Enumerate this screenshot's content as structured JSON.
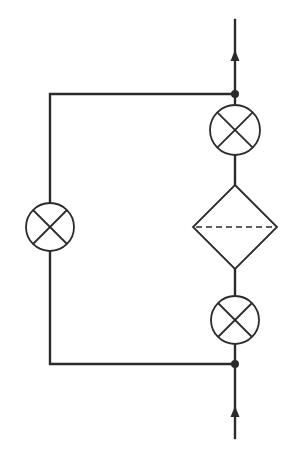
{
  "diagram": {
    "type": "signal-flow",
    "colors": {
      "line": "#2b2b2b",
      "background": "#ffffff"
    },
    "main_line": {
      "x": 235,
      "y_top": 20,
      "y_bottom": 438
    },
    "bypass_loop": {
      "x_left": 50,
      "y_top": 94,
      "y_bottom": 364
    },
    "nodes": [
      {
        "id": "junction-top",
        "x": 235,
        "y": 94
      },
      {
        "id": "junction-bottom",
        "x": 235,
        "y": 364
      }
    ],
    "arrows": [
      {
        "id": "arrow-output",
        "direction": "up",
        "x": 235,
        "y": 52
      },
      {
        "id": "arrow-input",
        "direction": "up",
        "x": 235,
        "y": 408
      }
    ],
    "components": [
      {
        "id": "multiplier-top",
        "symbol": "circle-cross",
        "cx": 235,
        "cy": 130,
        "r": 25
      },
      {
        "id": "filter-diamond",
        "symbol": "diamond-dashed",
        "cx": 235,
        "cy": 227,
        "half_w": 42,
        "half_h": 42
      },
      {
        "id": "multiplier-bottom",
        "symbol": "circle-cross",
        "cx": 235,
        "cy": 320,
        "r": 24
      },
      {
        "id": "multiplier-bypass",
        "symbol": "circle-cross",
        "cx": 50,
        "cy": 227,
        "r": 24
      }
    ]
  }
}
